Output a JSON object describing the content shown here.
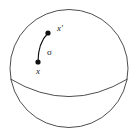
{
  "figure": {
    "kind": "geometric-diagram",
    "background_color": "#ffffff",
    "stroke_color": "#3a3a3a",
    "point_color": "#111111",
    "label_color": "#1a1a1a"
  },
  "sphere": {
    "name": "sphere-outline",
    "center_x": 69,
    "center_y": 68.5,
    "radius": 59,
    "stroke_width": 0.9
  },
  "equator": {
    "name": "equator-arc",
    "start_x": 10.5,
    "start_y": 79,
    "end_x": 127.5,
    "end_y": 79,
    "bulge_y": 106,
    "stroke_width": 0.9
  },
  "points": [
    {
      "id": "x",
      "label": "x",
      "dot_x": 38,
      "dot_y": 62,
      "dot_radius": 2.6,
      "label_x": 38,
      "label_y": 74,
      "label_anchor": "middle"
    },
    {
      "id": "x-prime",
      "label": "x'",
      "dot_x": 48,
      "dot_y": 33,
      "dot_radius": 2.6,
      "label_x": 57,
      "label_y": 31,
      "label_anchor": "start"
    }
  ],
  "geodesic": {
    "name": "geodesic-curve",
    "label": "σ",
    "label_x": 47,
    "label_y": 55,
    "start_x": 38,
    "start_y": 62,
    "ctrl_x": 38,
    "ctrl_y": 43,
    "end_x": 48,
    "end_y": 33,
    "stroke_width": 1.1
  }
}
